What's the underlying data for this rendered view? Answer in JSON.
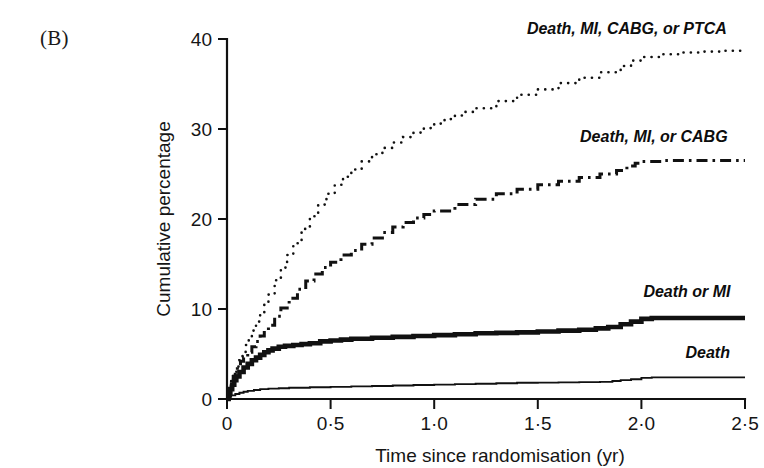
{
  "figure": {
    "panel_label": "(B)",
    "background_color": "#ffffff",
    "ink_color": "#111111"
  },
  "chart_data": {
    "type": "line",
    "title": "",
    "subtitle": "",
    "xlabel": "Time since randomisation (yr)",
    "ylabel": "Cumulative percentage",
    "xlim": [
      0,
      2.5
    ],
    "ylim": [
      0,
      40
    ],
    "grid": false,
    "legend_position": "inline-end-of-curve",
    "xticks": [
      0,
      0.5,
      1.0,
      1.5,
      2.0,
      2.5
    ],
    "xtick_labels": [
      "0",
      "0·5",
      "1·0",
      "1·5",
      "2·0",
      "2·5"
    ],
    "yticks": [
      0,
      10,
      20,
      30,
      40
    ],
    "ytick_labels": [
      "0",
      "10",
      "20",
      "30",
      "40"
    ],
    "annotations": [
      {
        "text": "Death, MI, CABG, or PTCA",
        "x": 1.93,
        "y": 40.6
      },
      {
        "text": "Death, MI, or CABG",
        "x": 2.06,
        "y": 28.6
      },
      {
        "text": "Death or MI",
        "x": 2.22,
        "y": 11.3
      },
      {
        "text": "Death",
        "x": 2.32,
        "y": 4.6
      }
    ],
    "series": [
      {
        "name": "Death, MI, CABG, or PTCA",
        "label": "Death, MI, CABG, or PTCA",
        "linestyle": "dotted",
        "linewidth": 2.6,
        "color": "#111111",
        "final_value": 38.8,
        "x": [
          0,
          0.01,
          0.02,
          0.03,
          0.045,
          0.06,
          0.075,
          0.09,
          0.105,
          0.12,
          0.14,
          0.16,
          0.18,
          0.2,
          0.23,
          0.26,
          0.29,
          0.32,
          0.36,
          0.4,
          0.44,
          0.48,
          0.52,
          0.56,
          0.6,
          0.65,
          0.7,
          0.75,
          0.8,
          0.85,
          0.9,
          0.95,
          1.0,
          1.05,
          1.1,
          1.15,
          1.2,
          1.3,
          1.4,
          1.5,
          1.6,
          1.7,
          1.8,
          1.9,
          1.95,
          2.0,
          2.1,
          2.2,
          2.3,
          2.4,
          2.5
        ],
        "y": [
          0,
          1.1,
          2.0,
          2.8,
          3.6,
          4.3,
          5.1,
          6.0,
          6.9,
          7.6,
          8.6,
          9.6,
          10.6,
          11.6,
          13.2,
          14.6,
          16.0,
          17.3,
          18.9,
          20.3,
          21.6,
          22.8,
          23.8,
          24.7,
          25.5,
          26.4,
          27.2,
          27.9,
          28.5,
          29.1,
          29.6,
          30.1,
          30.6,
          31.1,
          31.5,
          31.9,
          32.3,
          33.1,
          33.8,
          34.4,
          35.1,
          35.7,
          36.3,
          37.0,
          37.6,
          38.0,
          38.3,
          38.5,
          38.6,
          38.7,
          38.8
        ]
      },
      {
        "name": "Death, MI, or CABG",
        "label": "Death, MI, or CABG",
        "linestyle": "dashdot",
        "linewidth": 3.0,
        "color": "#111111",
        "final_value": 26.5,
        "x": [
          0,
          0.01,
          0.02,
          0.03,
          0.04,
          0.05,
          0.065,
          0.08,
          0.1,
          0.12,
          0.14,
          0.16,
          0.18,
          0.2,
          0.23,
          0.26,
          0.3,
          0.34,
          0.38,
          0.42,
          0.46,
          0.5,
          0.55,
          0.6,
          0.65,
          0.7,
          0.75,
          0.8,
          0.85,
          0.9,
          0.95,
          1.0,
          1.1,
          1.2,
          1.3,
          1.4,
          1.5,
          1.6,
          1.7,
          1.8,
          1.88,
          1.93,
          1.97,
          2.0,
          2.1,
          2.2,
          2.3,
          2.4,
          2.5
        ],
        "y": [
          0,
          1.0,
          1.8,
          2.5,
          3.1,
          3.6,
          4.2,
          4.6,
          5.2,
          5.8,
          6.4,
          7.0,
          7.6,
          8.2,
          9.2,
          10.1,
          11.2,
          12.2,
          13.1,
          13.9,
          14.6,
          15.2,
          16.0,
          16.5,
          17.2,
          17.9,
          18.5,
          19.1,
          19.6,
          20.1,
          20.5,
          20.9,
          21.6,
          22.2,
          22.8,
          23.3,
          23.8,
          24.2,
          24.6,
          25.0,
          25.4,
          25.9,
          26.2,
          26.4,
          26.5,
          26.5,
          26.5,
          26.5,
          26.5
        ]
      },
      {
        "name": "Death or MI",
        "label": "Death or MI",
        "linestyle": "solid-thick",
        "linewidth": 4.6,
        "color": "#111111",
        "final_value": 9.0,
        "x": [
          0,
          0.008,
          0.016,
          0.025,
          0.035,
          0.045,
          0.06,
          0.08,
          0.1,
          0.12,
          0.14,
          0.16,
          0.18,
          0.2,
          0.22,
          0.25,
          0.28,
          0.32,
          0.36,
          0.4,
          0.45,
          0.5,
          0.55,
          0.6,
          0.7,
          0.8,
          0.9,
          1.0,
          1.1,
          1.2,
          1.3,
          1.4,
          1.5,
          1.6,
          1.7,
          1.78,
          1.84,
          1.9,
          1.95,
          2.0,
          2.05,
          2.1,
          2.2,
          2.3,
          2.4,
          2.5
        ],
        "y": [
          0,
          0.6,
          1.1,
          1.6,
          2.1,
          2.5,
          3.0,
          3.5,
          3.9,
          4.3,
          4.6,
          4.9,
          5.2,
          5.4,
          5.6,
          5.8,
          5.9,
          6.0,
          6.1,
          6.2,
          6.4,
          6.5,
          6.6,
          6.7,
          6.8,
          6.9,
          7.0,
          7.1,
          7.2,
          7.3,
          7.35,
          7.4,
          7.5,
          7.6,
          7.7,
          7.85,
          8.0,
          8.3,
          8.6,
          8.9,
          9.0,
          9.0,
          9.0,
          9.0,
          9.0,
          9.0
        ]
      },
      {
        "name": "Death",
        "label": "Death",
        "linestyle": "solid-thin",
        "linewidth": 1.9,
        "color": "#111111",
        "final_value": 2.4,
        "x": [
          0,
          0.01,
          0.02,
          0.04,
          0.06,
          0.08,
          0.1,
          0.13,
          0.16,
          0.2,
          0.25,
          0.3,
          0.4,
          0.5,
          0.6,
          0.7,
          0.8,
          0.9,
          1.0,
          1.1,
          1.2,
          1.3,
          1.4,
          1.5,
          1.6,
          1.7,
          1.8,
          1.86,
          1.9,
          1.95,
          2.0,
          2.05,
          2.1,
          2.2,
          2.3,
          2.4,
          2.5
        ],
        "y": [
          0,
          0.25,
          0.4,
          0.55,
          0.7,
          0.8,
          0.9,
          1.0,
          1.1,
          1.15,
          1.2,
          1.25,
          1.3,
          1.35,
          1.4,
          1.45,
          1.5,
          1.55,
          1.6,
          1.65,
          1.7,
          1.75,
          1.8,
          1.82,
          1.85,
          1.88,
          1.9,
          2.0,
          2.1,
          2.2,
          2.35,
          2.4,
          2.4,
          2.4,
          2.4,
          2.4,
          2.4
        ]
      }
    ]
  }
}
